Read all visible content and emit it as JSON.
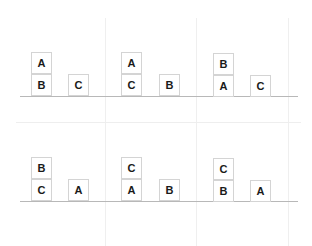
{
  "colors": {
    "block_border": "#d4d4d4",
    "ground": "#b8b8b8",
    "grid": "#efefef",
    "text": "#1a1a1a"
  },
  "rows": [
    {
      "panels": [
        {
          "stacks": [
            [
              "B",
              "A"
            ],
            [
              "C"
            ]
          ]
        },
        {
          "stacks": [
            [
              "C",
              "A"
            ],
            [
              "B"
            ]
          ]
        },
        {
          "stacks": [
            [
              "A",
              "B"
            ],
            [
              "C"
            ]
          ]
        }
      ]
    },
    {
      "panels": [
        {
          "stacks": [
            [
              "C",
              "B"
            ],
            [
              "A"
            ]
          ]
        },
        {
          "stacks": [
            [
              "A",
              "C"
            ],
            [
              "B"
            ]
          ]
        },
        {
          "stacks": [
            [
              "B",
              "C"
            ],
            [
              "A"
            ]
          ]
        }
      ]
    }
  ]
}
